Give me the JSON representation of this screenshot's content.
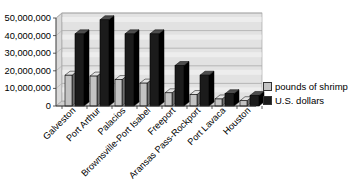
{
  "chart_data": {
    "type": "bar",
    "style": "3d-clustered",
    "title": "",
    "xlabel": "",
    "ylabel": "",
    "categories": [
      "Galveston",
      "Port Arthur",
      "Palacios",
      "Brownsville-Port Isabel",
      "Freeport",
      "Aransas Pass-Rockport",
      "Port Lavaca",
      "Houston"
    ],
    "series": [
      {
        "name": "pounds of shrimp",
        "color": "#c3c3c3",
        "top_color": "#e2e2e2",
        "side_color": "#6f6f6f",
        "values": [
          17500000,
          17000000,
          15000000,
          13000000,
          7500000,
          6500000,
          4000000,
          3000000
        ]
      },
      {
        "name": "U.S. dollars",
        "color": "#1b1b1b",
        "top_color": "#4d4d4d",
        "side_color": "#000000",
        "values": [
          41000000,
          49000000,
          41000000,
          41000000,
          23000000,
          17500000,
          7000000,
          6000000
        ]
      }
    ],
    "ylim": [
      0,
      50000000
    ],
    "ytick_interval": 10000000,
    "ytick_labels": [
      "0",
      "10,000,000",
      "20,000,000",
      "30,000,000",
      "40,000,000",
      "50,000,000"
    ],
    "grid": true,
    "legend_position": "right",
    "colors": {
      "background": "#ffffff",
      "wall": "#e2e2e2",
      "wall_band": "#ededed",
      "wall_border": "#9a9a9a",
      "side_wall": "#dadada",
      "floor": "#cfcfcf",
      "gridline": "#ababab",
      "axis": "#333333",
      "text": "#000000"
    }
  }
}
